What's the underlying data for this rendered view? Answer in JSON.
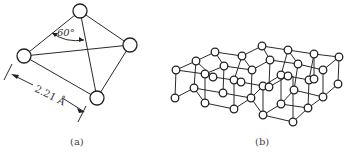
{
  "figure": {
    "panels": [
      {
        "id": "a",
        "caption": "(a)",
        "description": "tetrahedral arrangement of four atoms",
        "angle_label": "60°",
        "distance_label": "2.21 Å"
      },
      {
        "id": "b",
        "caption": "(b)",
        "description": "three-dimensional lattice of atoms in chair-like layers"
      }
    ]
  }
}
